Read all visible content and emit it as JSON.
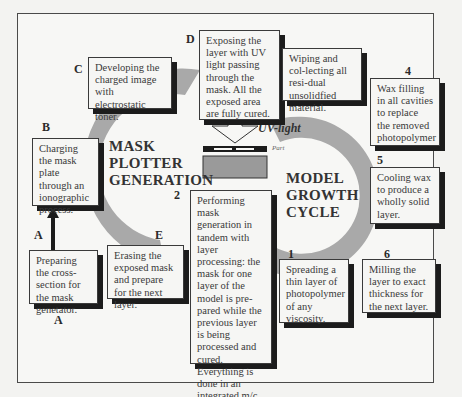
{
  "figure": {
    "left_cycle_title": [
      "MASK",
      "PLOTTER",
      "GENERATION"
    ],
    "right_cycle_title": [
      "MODEL",
      "GROWTH",
      "CYCLE"
    ],
    "uv_label": "UV-light",
    "part_label": "Part",
    "bottom_label": "A",
    "colors": {
      "arc": "#a9a9a9",
      "box_border": "#3a3a3a",
      "shadow": "#1c1c1c",
      "part_block": "#9a9a9a"
    }
  },
  "mask_steps": [
    {
      "id": "A",
      "text": "Preparing the cross-section for the mask genetator."
    },
    {
      "id": "B",
      "text": "Charging the mask plate through an ionographic process."
    },
    {
      "id": "C",
      "text": "Developing the charged image with electrostatic toner."
    },
    {
      "id": "D",
      "text": "Exposing the layer with UV light passing through the mask.  All the exposed area are fully cured."
    },
    {
      "id": "E",
      "text": "Erasing the exposed mask and prepare for the next layer."
    }
  ],
  "model_steps": [
    {
      "id": "1",
      "text": "Spreading a thin layer of photopolymer of any viscosity."
    },
    {
      "id": "2",
      "text": "Performing mask generation in tandem with layer processing: the mask for one layer of the model is pre-pared while the previous layer is being processed and cured. Everything is done in an integrated m/c."
    },
    {
      "id": "3",
      "text": "Wiping and col-lecting all resi-dual unsolidfied material."
    },
    {
      "id": "4",
      "text": "Wax filling in all cavities to replace the removed photopolymer"
    },
    {
      "id": "5",
      "text": "Cooling wax to produce a wholly solid layer."
    },
    {
      "id": "6",
      "text": "Milling the layer to exact thickness for the next layer."
    }
  ]
}
